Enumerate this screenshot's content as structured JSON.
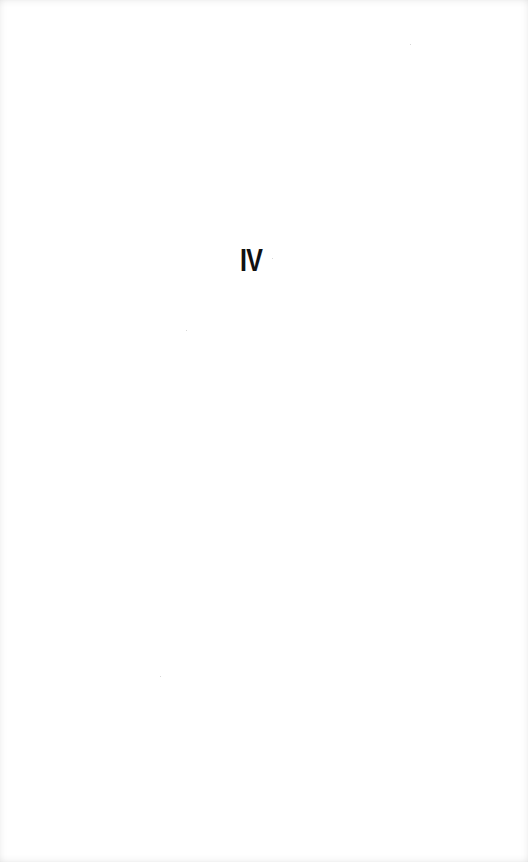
{
  "page": {
    "part_number": "IV"
  },
  "colors": {
    "background": "#ffffff",
    "text": "#111111"
  }
}
